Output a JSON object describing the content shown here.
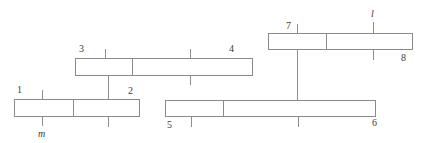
{
  "figure": {
    "type": "mechanism-linkage-diagram",
    "background_color": "#ffffff",
    "stroke_color": "#8a8a8a",
    "text_color": "#3a3a3a",
    "width": 428,
    "height": 143
  },
  "bars": [
    {
      "id": "bar-1-2",
      "left_label": "1",
      "right_label": "2",
      "x": 14,
      "y": 99,
      "width": 126,
      "height": 18,
      "divider_offset": 58
    },
    {
      "id": "bar-3-4",
      "left_label": "3",
      "right_label": "4",
      "x": 75,
      "y": 58,
      "width": 178,
      "height": 18,
      "divider_offset": 56
    },
    {
      "id": "bar-5-6",
      "left_label": "5",
      "right_label": "6",
      "x": 165,
      "y": 100,
      "width": 211,
      "height": 17,
      "divider_offset": 57
    },
    {
      "id": "bar-7-8",
      "left_label": "7",
      "right_label": "8",
      "x": 268,
      "y": 33,
      "width": 145,
      "height": 17,
      "divider_offset": 57
    }
  ],
  "labels": {
    "n1": "1",
    "n2": "2",
    "n3": "3",
    "n4": "4",
    "n5": "5",
    "n6": "6",
    "n7": "7",
    "n8": "8",
    "m": "m",
    "l": "l"
  },
  "ticks": [
    {
      "id": "tick-m-above",
      "x": 42,
      "y": 90,
      "height": 9
    },
    {
      "id": "tick-m-below",
      "x": 42,
      "y": 117,
      "height": 9
    },
    {
      "id": "tick-bar12-mid-above",
      "x": 108,
      "y": 90,
      "height": 9
    },
    {
      "id": "tick-bar12-mid-below",
      "x": 108,
      "y": 117,
      "height": 10
    },
    {
      "id": "tick-bar34-left-above",
      "x": 105,
      "y": 49,
      "height": 9
    },
    {
      "id": "tick-bar34-right-above",
      "x": 190,
      "y": 49,
      "height": 9
    },
    {
      "id": "tick-bar34-right-below",
      "x": 190,
      "y": 76,
      "height": 9
    },
    {
      "id": "tick-bar56-left-below",
      "x": 191,
      "y": 117,
      "height": 10
    },
    {
      "id": "tick-bar56-right-below",
      "x": 298,
      "y": 117,
      "height": 10
    },
    {
      "id": "tick-bar78-left-above",
      "x": 297,
      "y": 24,
      "height": 9
    },
    {
      "id": "tick-l-above",
      "x": 373,
      "y": 22,
      "height": 11
    },
    {
      "id": "tick-l-below",
      "x": 373,
      "y": 50,
      "height": 10
    }
  ],
  "connectors": [
    {
      "id": "connector-bar34-to-bar12",
      "x": 108,
      "y": 76,
      "height": 23
    },
    {
      "id": "connector-bar78-to-bar56",
      "x": 297,
      "y": 50,
      "height": 50
    }
  ],
  "label_positions": {
    "n1": {
      "x": 17,
      "y": 85
    },
    "n2": {
      "x": 128,
      "y": 86
    },
    "n3": {
      "x": 79,
      "y": 44
    },
    "n4": {
      "x": 229,
      "y": 44
    },
    "n5": {
      "x": 167,
      "y": 120
    },
    "n6": {
      "x": 372,
      "y": 118
    },
    "n7": {
      "x": 286,
      "y": 21
    },
    "n8": {
      "x": 401,
      "y": 53
    },
    "m": {
      "x": 38,
      "y": 129
    },
    "l": {
      "x": 371,
      "y": 9
    }
  }
}
